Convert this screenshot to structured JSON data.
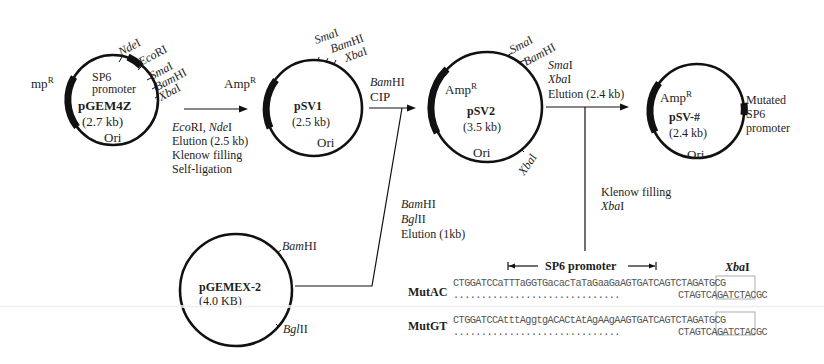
{
  "figure": {
    "plasmids": [
      {
        "id": "pGEM4Z",
        "name": "pGEM4Z",
        "size": "(2.7 kb)",
        "marker": "mp",
        "marker_sup": "R",
        "promoter_label_1": "SP6",
        "promoter_label_2": "promoter",
        "ori": "Ori",
        "sites": [
          {
            "italic": "Nde",
            "roman": "I"
          },
          {
            "italic": "Eco",
            "roman": "RI"
          },
          {
            "italic": "Sma",
            "roman": "I"
          },
          {
            "italic": "Bam",
            "roman": "HI"
          },
          {
            "italic": "Xba",
            "roman": "I"
          }
        ]
      },
      {
        "id": "pSV1",
        "name": "pSV1",
        "size": "(2.5 kb)",
        "marker": "Amp",
        "marker_sup": "R",
        "ori": "Ori",
        "sites": [
          {
            "italic": "Sma",
            "roman": "I"
          },
          {
            "italic": "Bam",
            "roman": "HI"
          },
          {
            "italic": "Xba",
            "roman": "I"
          }
        ]
      },
      {
        "id": "pSV2",
        "name": "pSV2",
        "size": "(3.5 kb)",
        "marker": "Amp",
        "marker_sup": "R",
        "ori": "Ori",
        "sites": [
          {
            "italic": "Sma",
            "roman": "I"
          },
          {
            "italic": "Bam",
            "roman": "HI"
          },
          {
            "italic": "Xba",
            "roman": "I"
          }
        ]
      },
      {
        "id": "pSV-#",
        "name": "pSV-#",
        "size": "(2.4 kb)",
        "marker": "Amp",
        "marker_sup": "R",
        "ori": "Ori",
        "feature_lines": [
          "Mutated",
          "SP6",
          "promoter"
        ]
      },
      {
        "id": "pGEMEX-2",
        "name": "pGEMEX-2",
        "size": "(4.0 KB)",
        "sites": [
          {
            "italic": "Bam",
            "roman": "HI"
          },
          {
            "italic": "Bgl",
            "roman": "II"
          }
        ]
      }
    ],
    "steps": {
      "step1": {
        "line1_italic_a": "Eco",
        "line1_roman_a": "RI, ",
        "line1_italic_b": "Nde",
        "line1_roman_b": "I",
        "line2": "Elution (2.5 kb)",
        "line3": "Klenow filling",
        "line4": "Self-ligation"
      },
      "step2": {
        "line1_italic": "Bam",
        "line1_roman": "HI",
        "line2": "CIP"
      },
      "step3": {
        "line1_italic": "Sma",
        "line1_roman": "I",
        "line2_italic": "Xba",
        "line2_roman": "I",
        "line3": "Elution (2.4 kb)"
      },
      "step_insert": {
        "line1_italic": "Bam",
        "line1_roman": "HI",
        "line2_italic": "Bgl",
        "line2_roman": "II",
        "line3": "Elution (1kb)"
      },
      "step_oligo": {
        "line1": "Klenow filling",
        "line2_italic": "Xba",
        "line2_roman": "I"
      }
    },
    "sequence_panel": {
      "promoter_label": "SP6 promoter",
      "site_label_italic": "Xba",
      "site_label_roman": "I",
      "rows": [
        {
          "name": "MutAC",
          "top": "CTGGATCCaTTTaGGTGacacTaTaGaaGaAGTGATCAGTCTAGATGCG",
          "bottom_dots": "..............................",
          "bottom": "CTAGTCAGATCTACGC"
        },
        {
          "name": "MutGT",
          "top": "CTGGATCCAtttAggtgACACtAtAgAAgAAGTGATCAGTCTAGATGCG",
          "bottom_dots": "..............................",
          "bottom": "CTAGTCAGATCTACGC"
        }
      ]
    }
  }
}
